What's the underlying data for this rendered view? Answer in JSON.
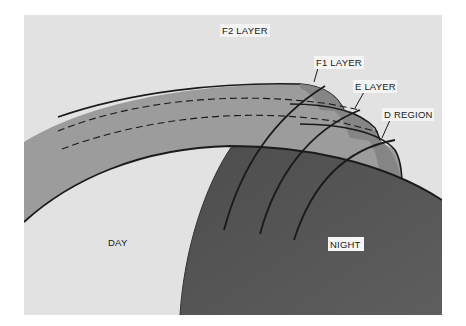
{
  "diagram": {
    "labels": {
      "f2_layer": "F2 LAYER",
      "f1_layer": "F1 LAYER",
      "e_layer": "E LAYER",
      "d_region": "D REGION",
      "day": "DAY",
      "night": "NIGHT"
    },
    "colors": {
      "sky": "#e2e2e2",
      "layer_band": "#9c9c9c",
      "layer_band_light": "#b4b4b4",
      "earth_night": "#555555",
      "earth_day": "#ffffff",
      "outline": "#1a1a1a"
    }
  }
}
